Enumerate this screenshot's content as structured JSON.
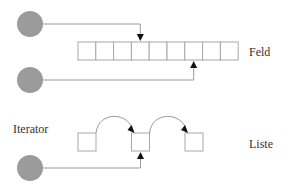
{
  "labels": {
    "array": "Feld",
    "list": "Liste",
    "iterator": "Iterator"
  },
  "array": {
    "cell_count": 9,
    "pointer_top_index": 3,
    "pointer_bottom_index": 6
  },
  "list": {
    "node_count": 3,
    "iterator_index": 1,
    "links": [
      [
        0,
        1
      ],
      [
        1,
        2
      ]
    ]
  },
  "colors": {
    "circle": "#9b9b9b",
    "line": "#9a9a9a",
    "arrowhead": "#111111",
    "text": "#333333"
  }
}
